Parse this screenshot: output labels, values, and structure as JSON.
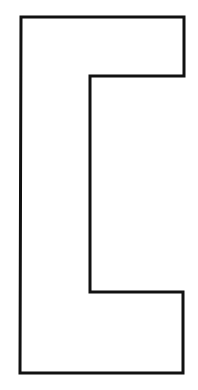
{
  "shape": {
    "kind": "bracket-outline",
    "stroke_color": "#111111",
    "fill_color": "#ffffff",
    "background": "#ffffff",
    "stroke_width": 3,
    "points": "21,17 184,17 184,76 90,76 90,292 183,292 183,373 20,373"
  }
}
